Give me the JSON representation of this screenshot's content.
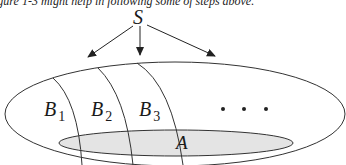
{
  "caption": "igure 1-3 might help in following some of steps above.",
  "diagram": {
    "source_node": "S",
    "partitions": [
      {
        "letter": "B",
        "sub": "1"
      },
      {
        "letter": "B",
        "sub": "2"
      },
      {
        "letter": "B",
        "sub": "3"
      }
    ],
    "ellipsis": "• • •",
    "event": "A",
    "colors": {
      "stroke": "#333333",
      "event_fill": "#e4e4e4"
    }
  }
}
